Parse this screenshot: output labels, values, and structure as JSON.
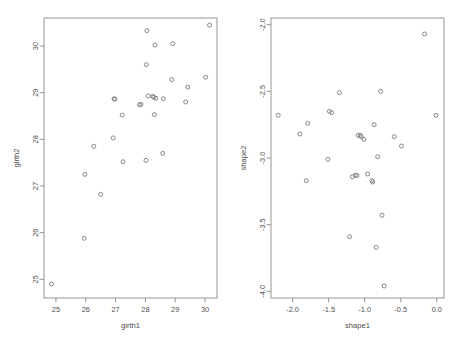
{
  "figure": {
    "background_color": "#ffffff",
    "marker_color": "#7a7a7a",
    "axis_color": "#8a8a8a",
    "text_color": "#4d4d4d",
    "marker_symbol": "open-circle"
  },
  "chart_data": [
    {
      "type": "scatter",
      "panel": "left",
      "title": "",
      "xlabel": "girth1",
      "ylabel": "girth2",
      "xlim": [
        24.6,
        30.4
      ],
      "ylim": [
        24.6,
        30.6
      ],
      "xticks": [
        25,
        26,
        27,
        28,
        29,
        30
      ],
      "yticks": [
        25,
        26,
        27,
        28,
        29,
        30
      ],
      "xtick_labels": [
        "25",
        "26",
        "27",
        "28",
        "29",
        "30"
      ],
      "ytick_labels": [
        "25",
        "26",
        "27",
        "28",
        "29",
        "30"
      ],
      "grid": false,
      "legend": "none",
      "n_points": 29,
      "points": [
        {
          "x": 24.85,
          "y": 24.9
        },
        {
          "x": 25.95,
          "y": 25.88
        },
        {
          "x": 25.97,
          "y": 27.25
        },
        {
          "x": 26.27,
          "y": 27.85
        },
        {
          "x": 26.5,
          "y": 26.82
        },
        {
          "x": 26.92,
          "y": 28.03
        },
        {
          "x": 26.95,
          "y": 28.87
        },
        {
          "x": 27.22,
          "y": 28.52
        },
        {
          "x": 27.25,
          "y": 27.52
        },
        {
          "x": 27.85,
          "y": 28.75
        },
        {
          "x": 28.02,
          "y": 27.55
        },
        {
          "x": 28.03,
          "y": 29.6
        },
        {
          "x": 28.05,
          "y": 30.33
        },
        {
          "x": 28.1,
          "y": 28.93
        },
        {
          "x": 28.28,
          "y": 28.9
        },
        {
          "x": 28.3,
          "y": 28.53
        },
        {
          "x": 28.32,
          "y": 30.02
        },
        {
          "x": 28.58,
          "y": 27.7
        },
        {
          "x": 28.6,
          "y": 28.87
        },
        {
          "x": 28.88,
          "y": 29.28
        },
        {
          "x": 28.92,
          "y": 30.05
        },
        {
          "x": 29.35,
          "y": 28.8
        },
        {
          "x": 29.42,
          "y": 29.12
        },
        {
          "x": 30.02,
          "y": 29.33
        },
        {
          "x": 30.15,
          "y": 30.45
        },
        {
          "x": 27.8,
          "y": 28.74
        },
        {
          "x": 28.25,
          "y": 28.92
        },
        {
          "x": 26.98,
          "y": 28.86
        },
        {
          "x": 28.35,
          "y": 28.88
        }
      ]
    },
    {
      "type": "scatter",
      "panel": "right",
      "title": "",
      "xlabel": "shape1",
      "ylabel": "shape2",
      "xlim": [
        -2.3,
        0.1
      ],
      "ylim": [
        -4.05,
        -1.95
      ],
      "xticks": [
        -2.0,
        -1.5,
        -1.0,
        -0.5,
        0.0
      ],
      "yticks": [
        -4.0,
        -3.5,
        -3.0,
        -2.5,
        -2.0
      ],
      "xtick_labels": [
        "-2.0",
        "-1.5",
        "-1.0",
        "-0.5",
        "0.0"
      ],
      "ytick_labels": [
        "-4.0",
        "-3.5",
        "-3.0",
        "-2.5",
        "-2.0"
      ],
      "grid": false,
      "legend": "none",
      "n_points": 29,
      "points": [
        {
          "x": -0.17,
          "y": -2.07
        },
        {
          "x": -1.35,
          "y": -2.51
        },
        {
          "x": -0.78,
          "y": -2.5
        },
        {
          "x": -2.2,
          "y": -2.68
        },
        {
          "x": -1.46,
          "y": -2.66
        },
        {
          "x": -0.01,
          "y": -2.68
        },
        {
          "x": -1.79,
          "y": -2.74
        },
        {
          "x": -0.87,
          "y": -2.75
        },
        {
          "x": -1.9,
          "y": -2.82
        },
        {
          "x": -1.09,
          "y": -2.83
        },
        {
          "x": -1.06,
          "y": -2.83
        },
        {
          "x": -0.59,
          "y": -2.84
        },
        {
          "x": -1.01,
          "y": -2.86
        },
        {
          "x": -0.49,
          "y": -2.91
        },
        {
          "x": -1.51,
          "y": -3.01
        },
        {
          "x": -0.82,
          "y": -2.99
        },
        {
          "x": -1.17,
          "y": -3.14
        },
        {
          "x": -1.11,
          "y": -3.13
        },
        {
          "x": -0.96,
          "y": -3.12
        },
        {
          "x": -1.81,
          "y": -3.17
        },
        {
          "x": -0.89,
          "y": -3.18
        },
        {
          "x": -0.76,
          "y": -3.43
        },
        {
          "x": -1.21,
          "y": -3.59
        },
        {
          "x": -0.84,
          "y": -3.67
        },
        {
          "x": -0.73,
          "y": -3.96
        },
        {
          "x": -1.05,
          "y": -2.84
        },
        {
          "x": -1.13,
          "y": -3.13
        },
        {
          "x": -0.9,
          "y": -3.17
        },
        {
          "x": -1.49,
          "y": -2.65
        }
      ]
    }
  ]
}
